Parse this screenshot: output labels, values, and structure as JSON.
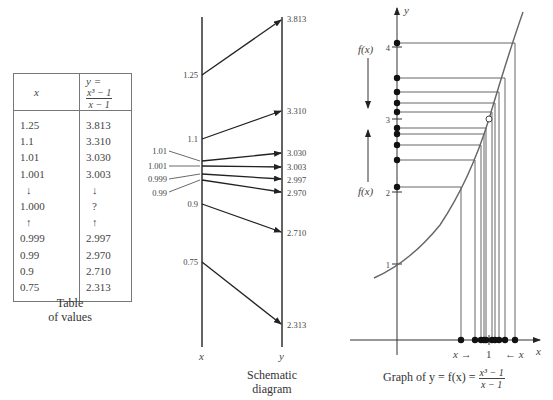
{
  "table": {
    "header_x": "x",
    "header_y_prefix": "y =",
    "header_y_num": "x³ − 1",
    "header_y_den": "x − 1",
    "rows": [
      {
        "x": "1.25",
        "y": "3.813"
      },
      {
        "x": "1.1",
        "y": "3.310"
      },
      {
        "x": "1.01",
        "y": "3.030"
      },
      {
        "x": "1.001",
        "y": "3.003"
      },
      {
        "x": "↓",
        "y": "↓"
      },
      {
        "x": "1.000",
        "y": "?"
      },
      {
        "x": "↑",
        "y": "↑"
      },
      {
        "x": "0.999",
        "y": "2.997"
      },
      {
        "x": "0.99",
        "y": "2.970"
      },
      {
        "x": "0.9",
        "y": "2.710"
      },
      {
        "x": "0.75",
        "y": "2.313"
      }
    ],
    "caption_line1": "Table",
    "caption_line2": "of values"
  },
  "schematic": {
    "x_axis_label": "x",
    "y_axis_label": "y",
    "x_labels": [
      "1.25",
      "1.1",
      "1.01",
      "1.001",
      "0.999",
      "0.99",
      "0.9",
      "0.75"
    ],
    "y_labels": [
      "3.813",
      "3.310",
      "3.030",
      "3.003",
      "2.997",
      "2.970",
      "2.710",
      "2.313"
    ],
    "caption_line1": "Schematic",
    "caption_line2": "diagram"
  },
  "graph": {
    "y_axis_label": "y",
    "x_axis_label": "x",
    "y_ticks": [
      "4",
      "3",
      "2",
      "1"
    ],
    "x_tick": "1",
    "fx_label_top": "f(x)",
    "fx_label_bottom": "f(x)",
    "x_left_arrow": "x →",
    "x_right_arrow": "← x",
    "caption_prefix": "Graph of y = f(x) =",
    "caption_num": "x³ − 1",
    "caption_den": "x − 1"
  }
}
